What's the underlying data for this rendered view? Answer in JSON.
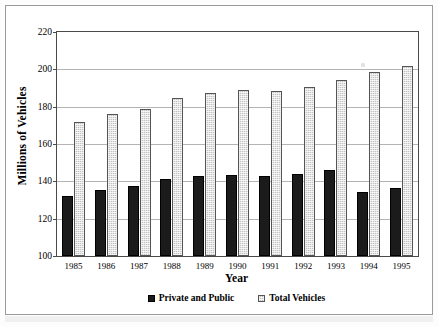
{
  "chart_data": {
    "type": "bar",
    "title": "",
    "xlabel": "Year",
    "ylabel": "Millions of Vehicles",
    "categories": [
      "1985",
      "1986",
      "1987",
      "1988",
      "1989",
      "1990",
      "1991",
      "1992",
      "1993",
      "1994",
      "1995"
    ],
    "series": [
      {
        "name": "Private and Public",
        "color": "#1b1b1b",
        "values": [
          131.9,
          135.5,
          137.3,
          141.4,
          143.1,
          143.5,
          143.0,
          144.2,
          146.3,
          134.2,
          136.4
        ]
      },
      {
        "name": "Total Vehicles",
        "color": "#c3c3c3",
        "values": [
          171.8,
          176.2,
          179.0,
          184.4,
          187.3,
          188.8,
          188.4,
          190.6,
          194.5,
          198.6,
          202.0
        ]
      }
    ],
    "ylim": [
      100,
      220
    ],
    "yticks": [
      100,
      120,
      140,
      160,
      180,
      200,
      220
    ],
    "ytick_labels": [
      "100",
      "120",
      "140",
      "160",
      "180",
      "200",
      "220"
    ],
    "grid": true,
    "legend_position": "bottom"
  },
  "legend": {
    "entries": [
      {
        "label": "Private and Public",
        "swatch": "black-solid-swatch"
      },
      {
        "label": "Total Vehicles",
        "swatch": "gray-hatched-swatch"
      }
    ]
  }
}
